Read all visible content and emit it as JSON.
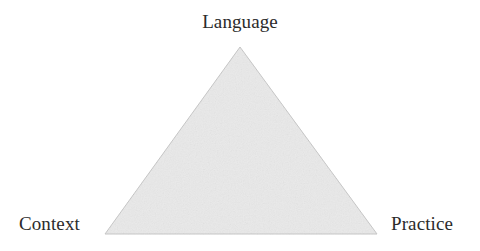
{
  "figure": {
    "kind": "triangle-diagram",
    "background_color": "#ffffff",
    "triangle": {
      "fill_color": "#eaeaea",
      "stroke_color": "#c9c9c9",
      "stroke_width": 1,
      "vertices": {
        "apex": {
          "x": 240,
          "y": 47
        },
        "bottom_left": {
          "x": 105,
          "y": 234
        },
        "bottom_right": {
          "x": 377,
          "y": 234
        }
      }
    },
    "labels": {
      "apex": "Language",
      "bottom_left": "Context",
      "bottom_right": "Practice"
    },
    "label_color": "#2b2b2b"
  }
}
